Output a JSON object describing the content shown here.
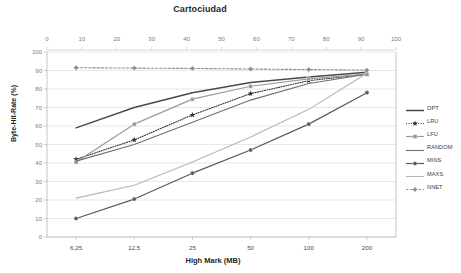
{
  "chart_data": {
    "type": "line",
    "title": "Cartociudad",
    "xlabel": "High Mark (MB)",
    "ylabel": "Byte-Hit-Rate (%)",
    "categories": [
      "6,25",
      "12,5",
      "25",
      "50",
      "100",
      "200"
    ],
    "ylim": [
      0,
      100
    ],
    "yticks": [
      0,
      10,
      20,
      30,
      40,
      50,
      60,
      70,
      80,
      90,
      100
    ],
    "secondary_xaxis": {
      "position": "top",
      "lim": [
        0,
        100
      ],
      "ticks": [
        0,
        10,
        20,
        30,
        40,
        50,
        60,
        70,
        80,
        90,
        100
      ]
    },
    "grid": true,
    "legend_position": "right",
    "series": [
      {
        "name": "OPT",
        "values": [
          59,
          70,
          78,
          83.5,
          86.5,
          89
        ],
        "color": "#4a4a4a",
        "style": "solid",
        "marker": "none",
        "width": 1.5
      },
      {
        "name": "LRU",
        "values": [
          42,
          52.5,
          66,
          77.5,
          84.5,
          88
        ],
        "color": "#2e2e2e",
        "style": "dotted",
        "marker": "star",
        "width": 1.1
      },
      {
        "name": "LFU",
        "values": [
          40.5,
          61,
          74.5,
          81.5,
          85.5,
          88
        ],
        "color": "#9b9b9b",
        "style": "solid",
        "marker": "square",
        "width": 1.2
      },
      {
        "name": "RANDOM",
        "values": [
          41,
          50,
          62,
          74,
          83,
          88
        ],
        "color": "#6e6e6e",
        "style": "solid",
        "marker": "none",
        "width": 1.1
      },
      {
        "name": "MINS",
        "values": [
          10,
          20.5,
          34.5,
          47,
          61,
          78
        ],
        "color": "#595959",
        "style": "solid",
        "marker": "circle",
        "width": 1.2
      },
      {
        "name": "MAXS",
        "values": [
          21,
          28,
          40.5,
          54,
          69,
          88.5
        ],
        "color": "#b5b5b5",
        "style": "solid",
        "marker": "none",
        "width": 1.1
      },
      {
        "name": "NNET",
        "values": [
          91.5,
          91.3,
          91.1,
          90.8,
          90.5,
          90.2
        ],
        "color": "#8f8f8f",
        "style": "dashed",
        "marker": "diamond",
        "width": 1.1
      }
    ]
  }
}
